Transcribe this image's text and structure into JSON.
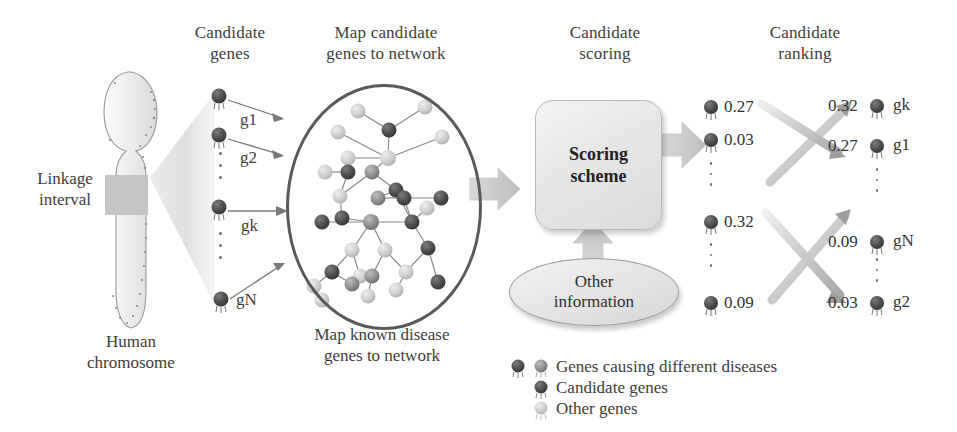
{
  "figure": {
    "type": "flow-diagram",
    "topic": "Network-based candidate disease gene prioritization"
  },
  "stage_titles": [
    {
      "id": "candidate-genes",
      "line1": "Candidate",
      "line2": "genes"
    },
    {
      "id": "map-to-network",
      "line1": "Map candidate",
      "line2": "genes to network"
    },
    {
      "id": "candidate-scoring",
      "line1": "Candidate",
      "line2": "scoring"
    },
    {
      "id": "candidate-ranking",
      "line1": "Candidate",
      "line2": "ranking"
    }
  ],
  "chromosome": {
    "linkage_label_line1": "Linkage",
    "linkage_label_line2": "interval",
    "caption_line1": "Human",
    "caption_line2": "chromosome"
  },
  "candidate_list": {
    "labels": [
      "g1",
      "g2",
      "gk",
      "gN"
    ]
  },
  "network": {
    "caption_line1": "Map known disease",
    "caption_line2": "genes to network"
  },
  "scoring": {
    "box_line1": "Scoring",
    "box_line2": "scheme",
    "other_info_line1": "Other",
    "other_info_line2": "information"
  },
  "scored_list": {
    "scores": [
      "0.27",
      "0.03",
      "0.32",
      "0.09"
    ]
  },
  "ranked_list": {
    "scores": [
      "0.32",
      "0.27",
      "0.09",
      "0.03"
    ],
    "labels": [
      "gk",
      "g1",
      "gN",
      "g2"
    ]
  },
  "legend": [
    {
      "id": "disease-genes",
      "text": "Genes causing different diseases"
    },
    {
      "id": "candidate-genes",
      "text": "Candidate genes"
    },
    {
      "id": "other-genes",
      "text": "Other genes"
    }
  ],
  "colors": {
    "ink": "#3d3d3d",
    "network_outline": "#5a5a5a",
    "node_dark": "#4a4a4a",
    "node_mid": "#8d8d8d",
    "node_light": "#c9c9c9",
    "arrow_grey": "#c8c8c8",
    "edge": "#8a8a8a"
  }
}
